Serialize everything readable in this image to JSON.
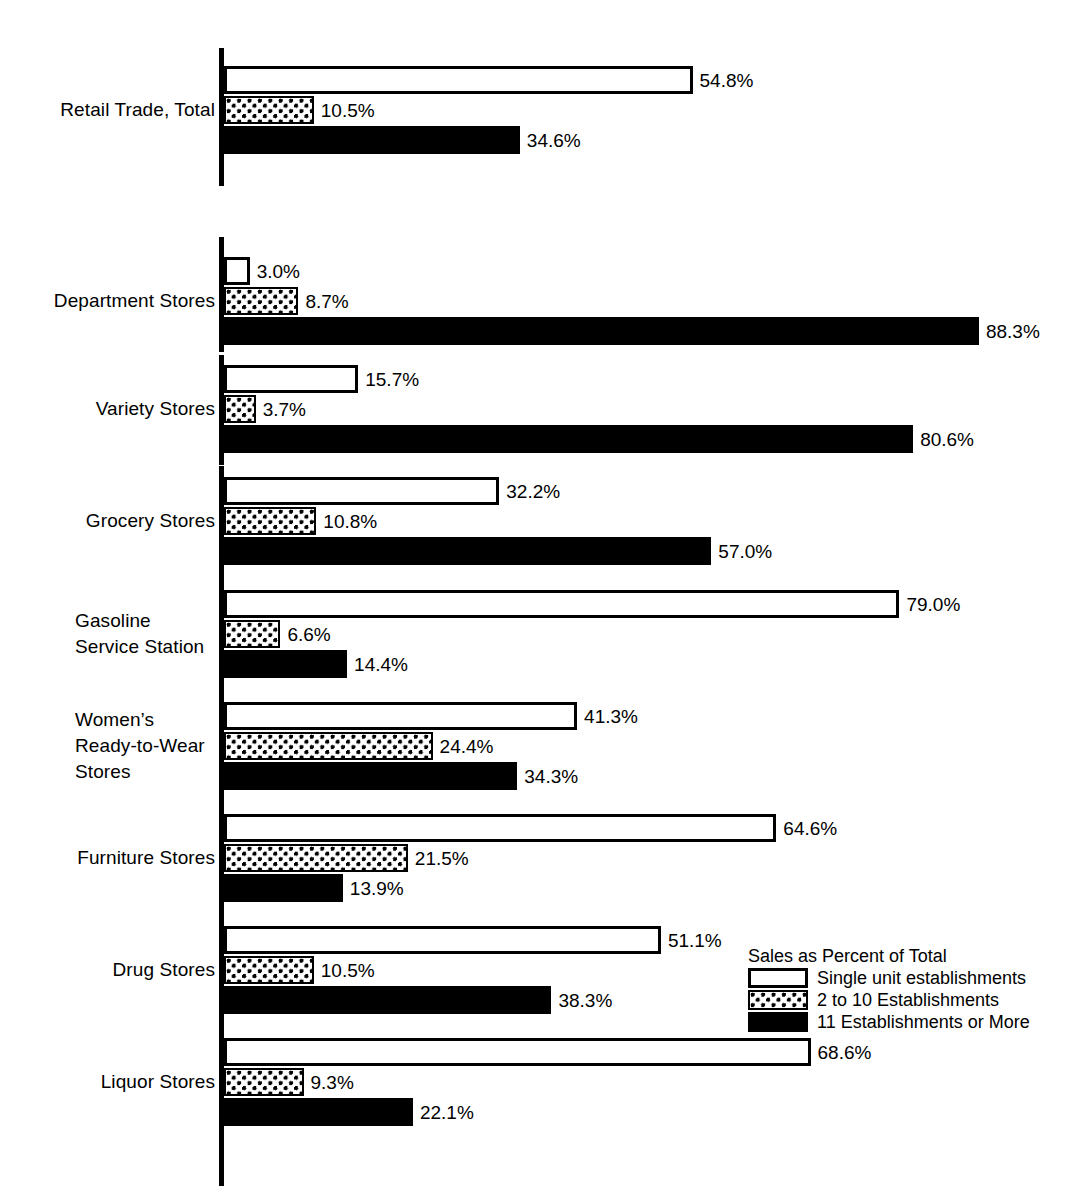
{
  "chart_data": {
    "type": "bar",
    "orientation": "horizontal",
    "title": "",
    "xlabel": "",
    "ylabel": "",
    "xlim": [
      0,
      100
    ],
    "grid": false,
    "legend_position": "inside-right-bottom",
    "legend_title": "Sales as Percent of Total",
    "value_suffix": "%",
    "series": [
      {
        "name": "Single unit establishments",
        "key": "single",
        "values": [
          54.8,
          3.0,
          15.7,
          32.2,
          79.0,
          41.3,
          64.6,
          51.1,
          68.6
        ]
      },
      {
        "name": "2 to 10 Establishments",
        "key": "multi",
        "values": [
          10.5,
          8.7,
          3.7,
          10.8,
          6.6,
          24.4,
          21.5,
          10.5,
          9.3
        ]
      },
      {
        "name": "11 Establishments or More",
        "key": "eleven",
        "values": [
          34.6,
          88.3,
          80.6,
          57.0,
          14.4,
          34.3,
          13.9,
          38.3,
          22.1
        ]
      }
    ],
    "categories": [
      "Retail Trade, Total",
      "Department Stores",
      "Variety Stores",
      "Grocery Stores",
      "Gasoline Service Station",
      "Women’s Ready-to-Wear Stores",
      "Furniture Stores",
      "Drug Stores",
      "Liquor Stores"
    ]
  },
  "groups": [
    {
      "id": "retail-trade-total",
      "label_lines": [
        "Retail Trade, Total"
      ],
      "label_align": "right",
      "bars": [
        {
          "series": "single",
          "label": "54.8%",
          "value": 54.8
        },
        {
          "series": "multi",
          "label": "10.5%",
          "value": 10.5
        },
        {
          "series": "eleven",
          "label": "34.6%",
          "value": 34.6
        }
      ]
    },
    {
      "id": "department-stores",
      "label_lines": [
        "Department Stores"
      ],
      "label_align": "right",
      "bars": [
        {
          "series": "single",
          "label": "3.0%",
          "value": 3.0
        },
        {
          "series": "multi",
          "label": "8.7%",
          "value": 8.7
        },
        {
          "series": "eleven",
          "label": "88.3%",
          "value": 88.3
        }
      ]
    },
    {
      "id": "variety-stores",
      "label_lines": [
        "Variety Stores"
      ],
      "label_align": "right",
      "bars": [
        {
          "series": "single",
          "label": "15.7%",
          "value": 15.7
        },
        {
          "series": "multi",
          "label": "3.7%",
          "value": 3.7
        },
        {
          "series": "eleven",
          "label": "80.6%",
          "value": 80.6
        }
      ]
    },
    {
      "id": "grocery-stores",
      "label_lines": [
        "Grocery Stores"
      ],
      "label_align": "right",
      "bars": [
        {
          "series": "single",
          "label": "32.2%",
          "value": 32.2
        },
        {
          "series": "multi",
          "label": "10.8%",
          "value": 10.8
        },
        {
          "series": "eleven",
          "label": "57.0%",
          "value": 57.0
        }
      ]
    },
    {
      "id": "gasoline-service-station",
      "label_lines": [
        "Gasoline",
        "Service Station"
      ],
      "label_align": "left",
      "bars": [
        {
          "series": "single",
          "label": "79.0%",
          "value": 79.0
        },
        {
          "series": "multi",
          "label": "6.6%",
          "value": 6.6
        },
        {
          "series": "eleven",
          "label": "14.4%",
          "value": 14.4
        }
      ]
    },
    {
      "id": "womens-ready-to-wear-stores",
      "label_lines": [
        "Women’s",
        "Ready-to-Wear",
        "Stores"
      ],
      "label_align": "left",
      "bars": [
        {
          "series": "single",
          "label": "41.3%",
          "value": 41.3
        },
        {
          "series": "multi",
          "label": "24.4%",
          "value": 24.4
        },
        {
          "series": "eleven",
          "label": "34.3%",
          "value": 34.3
        }
      ]
    },
    {
      "id": "furniture-stores",
      "label_lines": [
        "Furniture Stores"
      ],
      "label_align": "right",
      "bars": [
        {
          "series": "single",
          "label": "64.6%",
          "value": 64.6
        },
        {
          "series": "multi",
          "label": "21.5%",
          "value": 21.5
        },
        {
          "series": "eleven",
          "label": "13.9%",
          "value": 13.9
        }
      ]
    },
    {
      "id": "drug-stores",
      "label_lines": [
        "Drug Stores"
      ],
      "label_align": "right",
      "bars": [
        {
          "series": "single",
          "label": "51.1%",
          "value": 51.1
        },
        {
          "series": "multi",
          "label": "10.5%",
          "value": 10.5
        },
        {
          "series": "eleven",
          "label": "38.3%",
          "value": 38.3
        }
      ]
    },
    {
      "id": "liquor-stores",
      "label_lines": [
        "Liquor Stores"
      ],
      "label_align": "right",
      "bars": [
        {
          "series": "single",
          "label": "68.6%",
          "value": 68.6
        },
        {
          "series": "multi",
          "label": "9.3%",
          "value": 9.3
        },
        {
          "series": "eleven",
          "label": "22.1%",
          "value": 22.1
        }
      ]
    }
  ],
  "legend": {
    "title": "Sales as Percent of Total",
    "items": [
      {
        "key": "single",
        "label": "Single unit establishments"
      },
      {
        "key": "multi",
        "label": "2 to 10 Establishments"
      },
      {
        "key": "eleven",
        "label": "11 Establishments or More"
      }
    ]
  },
  "colors": {
    "ink": "#000000",
    "paper": "#ffffff"
  }
}
